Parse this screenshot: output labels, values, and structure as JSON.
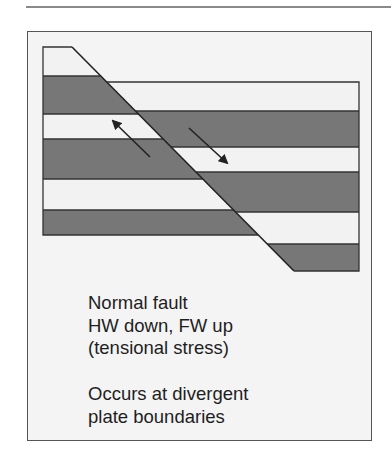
{
  "figure": {
    "type": "normal-fault-cross-section",
    "colors": {
      "dark_layer": "#777777",
      "light_layer": "#f2f2f2",
      "outline": "#333333",
      "panel_background": "#f4f4f4",
      "arrow": "#222222"
    },
    "footwall": {
      "label": "FW",
      "motion": "up",
      "layers": [
        {
          "fill": "light",
          "top": 47,
          "bottom": 76
        },
        {
          "fill": "dark",
          "top": 76,
          "bottom": 114
        },
        {
          "fill": "light",
          "top": 114,
          "bottom": 139
        },
        {
          "fill": "dark",
          "top": 139,
          "bottom": 179
        },
        {
          "fill": "light",
          "top": 179,
          "bottom": 210
        },
        {
          "fill": "dark",
          "top": 210,
          "bottom": 235
        }
      ]
    },
    "hanging_wall": {
      "label": "HW",
      "motion": "down",
      "layers": [
        {
          "fill": "light",
          "top": 82,
          "bottom": 111
        },
        {
          "fill": "dark",
          "top": 111,
          "bottom": 147
        },
        {
          "fill": "light",
          "top": 147,
          "bottom": 172
        },
        {
          "fill": "dark",
          "top": 172,
          "bottom": 212
        },
        {
          "fill": "light",
          "top": 212,
          "bottom": 244
        },
        {
          "fill": "dark",
          "top": 244,
          "bottom": 271
        }
      ]
    },
    "arrows": [
      {
        "name": "footwall-up-arrow",
        "direction": "up-left"
      },
      {
        "name": "hanging-wall-down-arrow",
        "direction": "down-right"
      }
    ]
  },
  "caption": {
    "block1": [
      "Normal fault",
      "HW down, FW up",
      "(tensional stress)"
    ],
    "block2": [
      "Occurs at divergent",
      "plate boundaries"
    ]
  }
}
